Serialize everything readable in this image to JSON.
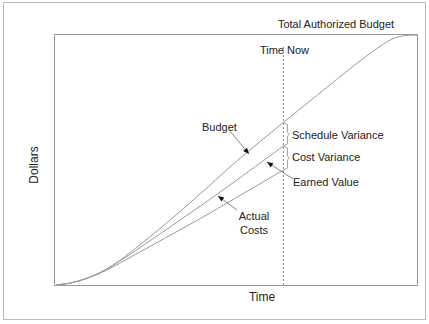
{
  "chart_data": {
    "type": "line",
    "title": "",
    "xlabel": "Time",
    "ylabel": "Dollars",
    "xlim": [
      0,
      100
    ],
    "ylim": [
      0,
      100
    ],
    "grid": false,
    "time_now": 63,
    "time_now_label": "Time Now",
    "total_budget_label": "Total Authorized Budget",
    "series": [
      {
        "name": "Budget",
        "label": "Budget",
        "color": "#999999",
        "points": [
          [
            0,
            0
          ],
          [
            4,
            0.8
          ],
          [
            8,
            2.4
          ],
          [
            12,
            4.8
          ],
          [
            16,
            8.2
          ],
          [
            20,
            12.4
          ],
          [
            30,
            24
          ],
          [
            40,
            36.5
          ],
          [
            50,
            49.5
          ],
          [
            63,
            65
          ],
          [
            75,
            79
          ],
          [
            85,
            90.5
          ],
          [
            92,
            97.5
          ],
          [
            96,
            99.6
          ],
          [
            100,
            100
          ]
        ]
      },
      {
        "name": "Earned Value",
        "label": "Earned Value",
        "color": "#999999",
        "points": [
          [
            0,
            0
          ],
          [
            4,
            0.8
          ],
          [
            8,
            2.4
          ],
          [
            12,
            4.8
          ],
          [
            16,
            8.0
          ],
          [
            20,
            11.8
          ],
          [
            30,
            21.6
          ],
          [
            40,
            31.6
          ],
          [
            50,
            41.9
          ],
          [
            63,
            55.6
          ]
        ]
      },
      {
        "name": "Actual Costs",
        "label": "Actual Costs",
        "color": "#999999",
        "points": [
          [
            0,
            0
          ],
          [
            4,
            0.8
          ],
          [
            8,
            2.4
          ],
          [
            12,
            4.6
          ],
          [
            16,
            7.4
          ],
          [
            20,
            10.6
          ],
          [
            30,
            18.6
          ],
          [
            40,
            26.6
          ],
          [
            50,
            35
          ],
          [
            63,
            46
          ]
        ]
      }
    ],
    "annotations": [
      {
        "text": "Schedule Variance",
        "between": [
          "Budget",
          "Earned Value"
        ],
        "at_time": 63
      },
      {
        "text": "Cost Variance",
        "between": [
          "Earned Value",
          "Actual Costs"
        ],
        "at_time": 63
      }
    ]
  }
}
